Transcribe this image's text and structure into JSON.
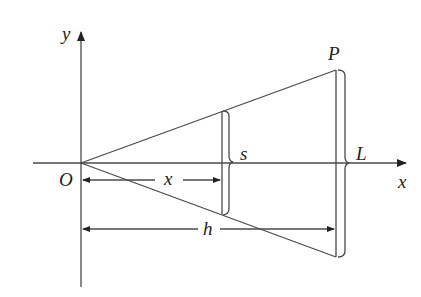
{
  "diagram": {
    "type": "geometry",
    "labels": {
      "y_axis": "y",
      "x_axis": "x",
      "origin": "O",
      "point": "P",
      "distance_x": "x",
      "distance_h": "h",
      "segment_s": "s",
      "segment_L": "L"
    },
    "colors": {
      "line": "#4a4a4a",
      "text": "#222222",
      "background": "#ffffff"
    }
  }
}
